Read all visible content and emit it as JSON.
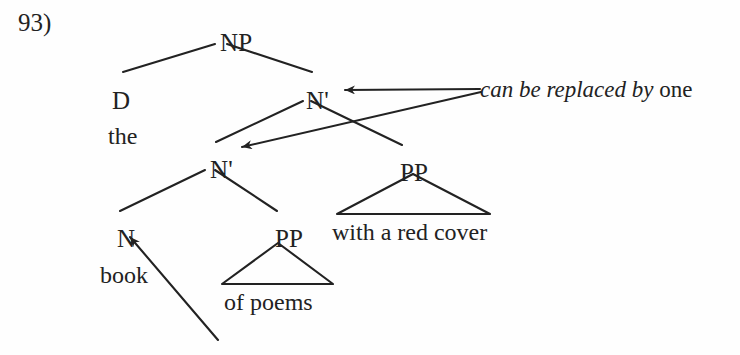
{
  "figure": {
    "example_number": "93)",
    "type": "syntax-tree",
    "ink_color": "#222222",
    "background_color": "#fefefe"
  },
  "tree": {
    "nodes": [
      {
        "id": "np",
        "label": "NP",
        "x": 220,
        "y": 30
      },
      {
        "id": "d",
        "label": "D",
        "x": 112,
        "y": 88
      },
      {
        "id": "nbar1",
        "label": "N'",
        "x": 306,
        "y": 88
      },
      {
        "id": "nbar2",
        "label": "N'",
        "x": 210,
        "y": 157
      },
      {
        "id": "pp2",
        "label": "PP",
        "x": 400,
        "y": 160
      },
      {
        "id": "n",
        "label": "N",
        "x": 117,
        "y": 226
      },
      {
        "id": "pp1",
        "label": "PP",
        "x": 275,
        "y": 226
      }
    ],
    "terminals": [
      {
        "id": "the",
        "label": "the",
        "x": 108,
        "y": 124
      },
      {
        "id": "book",
        "label": "book",
        "x": 100,
        "y": 263
      },
      {
        "id": "of_poems",
        "label": "of poems",
        "x": 224,
        "y": 290
      },
      {
        "id": "with_cover",
        "label": "with a red cover",
        "x": 332,
        "y": 220
      }
    ]
  },
  "annotation": {
    "italic_text": "can be replaced by",
    "roman_text": "one",
    "x": 480,
    "y": 78
  }
}
